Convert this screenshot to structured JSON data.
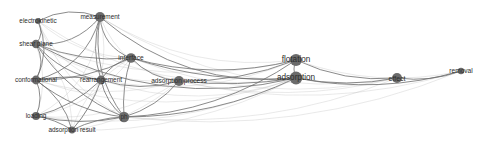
{
  "figure": {
    "type": "network-graph",
    "background_color": "#ffffff",
    "node_color": "#6b6b6b",
    "edge_color": "#9a9a9a",
    "label_color": "#2b2b2b",
    "width": 480,
    "height": 153
  },
  "chart_data": {
    "type": "scatter",
    "title": "",
    "subtitle": "",
    "xlabel": "",
    "ylabel": "",
    "grid": false,
    "legend": "none",
    "nodes": [
      {
        "id": "measurement",
        "label": "measurement",
        "x": 100,
        "y": 17,
        "r": 5.0,
        "font": 6.4
      },
      {
        "id": "electrokinetic",
        "label": "electrokinetic",
        "x": 38,
        "y": 21,
        "r": 3.0,
        "font": 6.4
      },
      {
        "id": "shear-plane",
        "label": "shear plane",
        "x": 36,
        "y": 44,
        "r": 4.2,
        "font": 6.4
      },
      {
        "id": "interface",
        "label": "interface",
        "x": 131,
        "y": 58,
        "r": 4.8,
        "font": 6.6
      },
      {
        "id": "conformational",
        "label": "conformational",
        "x": 36,
        "y": 80,
        "r": 4.4,
        "font": 6.4
      },
      {
        "id": "rearrangement",
        "label": "rearrangement",
        "x": 101,
        "y": 80,
        "r": 4.4,
        "font": 6.4
      },
      {
        "id": "adsorption-process",
        "label": "adsorption process",
        "x": 179,
        "y": 81,
        "r": 5.0,
        "font": 6.6
      },
      {
        "id": "loading",
        "label": "loading",
        "x": 36,
        "y": 116,
        "r": 4.0,
        "font": 6.4
      },
      {
        "id": "ph",
        "label": "ph",
        "x": 124,
        "y": 117,
        "r": 5.2,
        "font": 6.4
      },
      {
        "id": "adsorption-result",
        "label": "adsorption result",
        "x": 72,
        "y": 130,
        "r": 3.4,
        "font": 6.4
      },
      {
        "id": "flotation",
        "label": "flotation",
        "x": 296,
        "y": 60,
        "r": 6.0,
        "font": 8.2
      },
      {
        "id": "adsorption",
        "label": "adsorption",
        "x": 296,
        "y": 78,
        "r": 6.4,
        "font": 8.2
      },
      {
        "id": "effect",
        "label": "effect",
        "x": 397,
        "y": 78,
        "r": 5.0,
        "font": 7.0
      },
      {
        "id": "removal",
        "label": "removal",
        "x": 461,
        "y": 71,
        "r": 3.2,
        "font": 6.6
      }
    ],
    "edges": [
      {
        "source": "measurement",
        "target": "electrokinetic",
        "weight": 2,
        "bow": 14
      },
      {
        "source": "measurement",
        "target": "shear-plane",
        "weight": 2,
        "bow": -18
      },
      {
        "source": "measurement",
        "target": "interface",
        "weight": 2,
        "bow": 16
      },
      {
        "source": "measurement",
        "target": "conformational",
        "weight": 2,
        "bow": -26
      },
      {
        "source": "measurement",
        "target": "rearrangement",
        "weight": 2,
        "bow": 10
      },
      {
        "source": "measurement",
        "target": "loading",
        "weight": 1,
        "bow": -34
      },
      {
        "source": "measurement",
        "target": "ph",
        "weight": 2,
        "bow": 22
      },
      {
        "source": "measurement",
        "target": "adsorption-result",
        "weight": 1,
        "bow": -30
      },
      {
        "source": "measurement",
        "target": "adsorption-process",
        "weight": 1,
        "bow": 28
      },
      {
        "source": "measurement",
        "target": "flotation",
        "weight": 1,
        "bow": 36
      },
      {
        "source": "measurement",
        "target": "adsorption",
        "weight": 2,
        "bow": 44
      },
      {
        "source": "measurement",
        "target": "effect",
        "weight": 1,
        "bow": 58
      },
      {
        "source": "electrokinetic",
        "target": "shear-plane",
        "weight": 2,
        "bow": -8
      },
      {
        "source": "electrokinetic",
        "target": "interface",
        "weight": 1,
        "bow": 18
      },
      {
        "source": "electrokinetic",
        "target": "conformational",
        "weight": 2,
        "bow": -14
      },
      {
        "source": "electrokinetic",
        "target": "rearrangement",
        "weight": 1,
        "bow": 20
      },
      {
        "source": "electrokinetic",
        "target": "ph",
        "weight": 1,
        "bow": 26
      },
      {
        "source": "electrokinetic",
        "target": "adsorption",
        "weight": 1,
        "bow": 52
      },
      {
        "source": "shear-plane",
        "target": "interface",
        "weight": 2,
        "bow": 12
      },
      {
        "source": "shear-plane",
        "target": "conformational",
        "weight": 2,
        "bow": -10
      },
      {
        "source": "shear-plane",
        "target": "rearrangement",
        "weight": 2,
        "bow": 14
      },
      {
        "source": "shear-plane",
        "target": "loading",
        "weight": 1,
        "bow": -14
      },
      {
        "source": "shear-plane",
        "target": "ph",
        "weight": 2,
        "bow": 18
      },
      {
        "source": "shear-plane",
        "target": "adsorption-result",
        "weight": 1,
        "bow": -20
      },
      {
        "source": "shear-plane",
        "target": "adsorption-process",
        "weight": 1,
        "bow": 24
      },
      {
        "source": "shear-plane",
        "target": "adsorption",
        "weight": 2,
        "bow": 50
      },
      {
        "source": "shear-plane",
        "target": "flotation",
        "weight": 1,
        "bow": 40
      },
      {
        "source": "interface",
        "target": "conformational",
        "weight": 2,
        "bow": -12
      },
      {
        "source": "interface",
        "target": "rearrangement",
        "weight": 2,
        "bow": 8
      },
      {
        "source": "interface",
        "target": "adsorption-process",
        "weight": 2,
        "bow": 10
      },
      {
        "source": "interface",
        "target": "ph",
        "weight": 2,
        "bow": 6
      },
      {
        "source": "interface",
        "target": "loading",
        "weight": 1,
        "bow": -22
      },
      {
        "source": "interface",
        "target": "adsorption-result",
        "weight": 1,
        "bow": 18
      },
      {
        "source": "interface",
        "target": "flotation",
        "weight": 2,
        "bow": 22
      },
      {
        "source": "interface",
        "target": "adsorption",
        "weight": 2,
        "bow": 16
      },
      {
        "source": "interface",
        "target": "effect",
        "weight": 1,
        "bow": 40
      },
      {
        "source": "conformational",
        "target": "rearrangement",
        "weight": 2,
        "bow": -6
      },
      {
        "source": "conformational",
        "target": "loading",
        "weight": 2,
        "bow": -8
      },
      {
        "source": "conformational",
        "target": "ph",
        "weight": 2,
        "bow": 14
      },
      {
        "source": "conformational",
        "target": "adsorption-result",
        "weight": 2,
        "bow": -12
      },
      {
        "source": "conformational",
        "target": "adsorption-process",
        "weight": 1,
        "bow": 22
      },
      {
        "source": "conformational",
        "target": "adsorption",
        "weight": 1,
        "bow": 46
      },
      {
        "source": "rearrangement",
        "target": "loading",
        "weight": 2,
        "bow": -10
      },
      {
        "source": "rearrangement",
        "target": "ph",
        "weight": 2,
        "bow": 8
      },
      {
        "source": "rearrangement",
        "target": "adsorption-result",
        "weight": 2,
        "bow": -6
      },
      {
        "source": "rearrangement",
        "target": "adsorption-process",
        "weight": 2,
        "bow": 12
      },
      {
        "source": "rearrangement",
        "target": "adsorption",
        "weight": 1,
        "bow": 34
      },
      {
        "source": "rearrangement",
        "target": "flotation",
        "weight": 1,
        "bow": 30
      },
      {
        "source": "loading",
        "target": "ph",
        "weight": 2,
        "bow": 10
      },
      {
        "source": "loading",
        "target": "adsorption-result",
        "weight": 2,
        "bow": -4
      },
      {
        "source": "loading",
        "target": "adsorption-process",
        "weight": 1,
        "bow": 26
      },
      {
        "source": "loading",
        "target": "adsorption",
        "weight": 1,
        "bow": 40
      },
      {
        "source": "ph",
        "target": "adsorption-result",
        "weight": 2,
        "bow": 6
      },
      {
        "source": "ph",
        "target": "adsorption-process",
        "weight": 2,
        "bow": 10
      },
      {
        "source": "ph",
        "target": "flotation",
        "weight": 2,
        "bow": 26
      },
      {
        "source": "ph",
        "target": "adsorption",
        "weight": 2,
        "bow": 20
      },
      {
        "source": "ph",
        "target": "effect",
        "weight": 1,
        "bow": 34
      },
      {
        "source": "ph",
        "target": "removal",
        "weight": 1,
        "bow": 44
      },
      {
        "source": "adsorption-result",
        "target": "adsorption-process",
        "weight": 1,
        "bow": 18
      },
      {
        "source": "adsorption-result",
        "target": "adsorption",
        "weight": 1,
        "bow": 30
      },
      {
        "source": "adsorption-process",
        "target": "flotation",
        "weight": 2,
        "bow": 12
      },
      {
        "source": "adsorption-process",
        "target": "adsorption",
        "weight": 2,
        "bow": 8
      },
      {
        "source": "adsorption-process",
        "target": "effect",
        "weight": 1,
        "bow": 26
      },
      {
        "source": "adsorption-process",
        "target": "removal",
        "weight": 1,
        "bow": 38
      },
      {
        "source": "flotation",
        "target": "adsorption",
        "weight": 2,
        "bow": 4
      },
      {
        "source": "flotation",
        "target": "effect",
        "weight": 2,
        "bow": 14
      },
      {
        "source": "flotation",
        "target": "removal",
        "weight": 1,
        "bow": 24
      },
      {
        "source": "adsorption",
        "target": "effect",
        "weight": 2,
        "bow": 10
      },
      {
        "source": "adsorption",
        "target": "removal",
        "weight": 2,
        "bow": 20
      },
      {
        "source": "effect",
        "target": "removal",
        "weight": 2,
        "bow": 8
      }
    ]
  }
}
